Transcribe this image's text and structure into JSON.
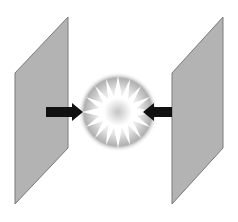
{
  "diagram": {
    "title_cutoff": "",
    "colors": {
      "plate_fill": "#b3b3b3",
      "plate_stroke": "#7a7a7a",
      "arrow": "#111111",
      "burst_outer": "#8a8a8a",
      "burst_inner": "#ffffff",
      "burst_center": "#c9c9c9"
    },
    "elements": [
      {
        "name": "left-plate",
        "shape": "parallelogram"
      },
      {
        "name": "right-plate",
        "shape": "parallelogram"
      },
      {
        "name": "left-arrow",
        "direction": "right"
      },
      {
        "name": "right-arrow",
        "direction": "left"
      },
      {
        "name": "center-starburst",
        "shape": "star-burst"
      }
    ]
  }
}
